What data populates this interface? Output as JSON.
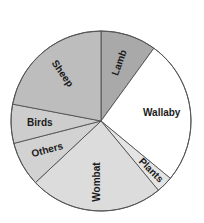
{
  "chart_data": {
    "type": "pie",
    "title": "",
    "start_angle_deg": 0,
    "direction": "clockwise",
    "slices": [
      {
        "label": "Lamb",
        "value": 10,
        "color": "#a9a9a9",
        "label_rotate": -70
      },
      {
        "label": "Wallaby",
        "value": 26,
        "color": "#ffffff",
        "label_rotate": 0
      },
      {
        "label": "Plants",
        "value": 3,
        "color": "#e4e4e4",
        "label_rotate": 45
      },
      {
        "label": "Wombat",
        "value": 24,
        "color": "#dcdcdc",
        "label_rotate": -90
      },
      {
        "label": "Others",
        "value": 8,
        "color": "#d2d2d2",
        "label_rotate": -15
      },
      {
        "label": "Birds",
        "value": 7,
        "color": "#cdcdcd",
        "label_rotate": 0
      },
      {
        "label": "Sheep",
        "value": 22,
        "color": "#bdbdbd",
        "label_rotate": 55
      }
    ],
    "legend": "none",
    "units": "percent (estimated from angles)"
  },
  "geometry": {
    "cx": 101,
    "cy": 121,
    "r": 90
  }
}
